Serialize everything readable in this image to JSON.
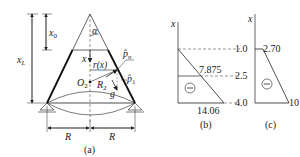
{
  "figure_a": {
    "caption": "(a)",
    "labels": {
      "x0": "x",
      "x0_sub": "0",
      "xL": "x",
      "xL_sub": "L",
      "alpha": "α",
      "x": "x",
      "r_of_x": "r(x)",
      "p_n": "p̂",
      "p_n_sub": "n",
      "p_1": "p̂",
      "p_1_sub": "1",
      "O2": "O",
      "O2_sub": "2",
      "R2": "R",
      "R2_sub": "2",
      "g": "g",
      "R_left": "R",
      "R_right": "R"
    }
  },
  "figure_b": {
    "caption": "(b)",
    "axis_label": "x",
    "value_mid": "7.875",
    "value_bottom": "14.06",
    "sign": "−"
  },
  "figure_c": {
    "caption": "(c)",
    "axis_label": "x",
    "ticks": [
      "1.0",
      "2.5",
      "4.0"
    ],
    "value_top": "2.70",
    "value_bottom": "10",
    "sign": "−"
  },
  "colors": {
    "line": "#222222",
    "dashed": "#555555"
  }
}
